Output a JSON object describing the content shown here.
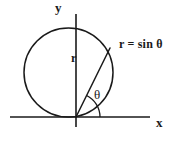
{
  "figure": {
    "background_color": "#ffffff",
    "stroke_color": "#1a1a1a",
    "labels": {
      "y_axis": "y",
      "x_axis": "x",
      "radius": "r",
      "angle": "θ",
      "equation": "r = sin θ"
    }
  },
  "chart_data": {
    "type": "line",
    "title": "r = sin θ",
    "plot_kind": "polar-curve",
    "equation": "r = sin θ",
    "xlabel": "x",
    "ylabel": "y",
    "grid": false,
    "legend": null,
    "curve": {
      "name": "r = sin θ",
      "description": "Circle of radius 1/2 centered at (0, 1/2), tangent to the x-axis at the origin",
      "center_xy": [
        0,
        0.5
      ],
      "radius": 0.5,
      "theta_range_deg": [
        0,
        180
      ],
      "points_polar": [
        {
          "theta_deg": 0,
          "r": 0.0
        },
        {
          "theta_deg": 30,
          "r": 0.5
        },
        {
          "theta_deg": 45,
          "r": 0.707
        },
        {
          "theta_deg": 60,
          "r": 0.866
        },
        {
          "theta_deg": 90,
          "r": 1.0
        },
        {
          "theta_deg": 120,
          "r": 0.866
        },
        {
          "theta_deg": 135,
          "r": 0.707
        },
        {
          "theta_deg": 150,
          "r": 0.5
        },
        {
          "theta_deg": 180,
          "r": 0.0
        }
      ]
    },
    "annotations": [
      {
        "name": "radius-vector",
        "label": "r",
        "from_xy": [
          0,
          0
        ],
        "to_theta_deg": 62,
        "to_r": 0.883
      },
      {
        "name": "angle-arc",
        "label": "θ",
        "vertex_xy": [
          0,
          0
        ],
        "from_deg": 0,
        "to_deg": 62
      },
      {
        "name": "curve-label",
        "label": "r = sin θ"
      }
    ],
    "axes": {
      "x_axis_drawn": true,
      "y_axis_drawn": true,
      "origin_marked": true,
      "tick_labels": []
    }
  },
  "geometry_px": {
    "origin": [
      76,
      117
    ],
    "circle_center": [
      68.5,
      72.5
    ],
    "circle_radius": 44.5,
    "y_axis": {
      "x": 76,
      "y_top": 14,
      "y_bottom": 127
    },
    "x_axis": {
      "y": 117,
      "x_left": 10,
      "x_right": 150
    },
    "radius_line": {
      "x1": 76,
      "y1": 117,
      "x2": 110,
      "y2": 48
    },
    "angle_arc_radius": 24
  }
}
